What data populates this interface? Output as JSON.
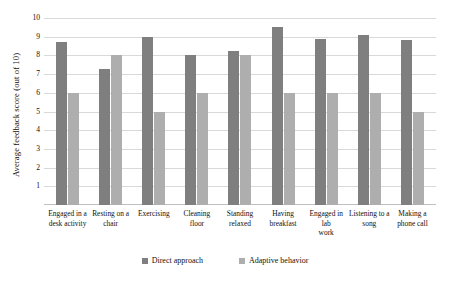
{
  "chart_data": {
    "type": "bar",
    "title": "",
    "xlabel": "",
    "ylabel": "Average feedback score (out of 10)",
    "ylim": [
      0,
      10
    ],
    "ytick_labels": [
      "10",
      "9",
      "8",
      "7",
      "6",
      "5",
      "4",
      "3",
      "2",
      "1"
    ],
    "ytick_values": [
      10,
      9,
      8,
      7,
      6,
      5,
      4,
      3,
      2,
      1
    ],
    "grid": true,
    "legend_position": "bottom",
    "categories": [
      "Engaged in a desk activity",
      "Resting on a chair",
      "Exercising",
      "Cleaning floor",
      "Standing relaxed",
      "Having breakfast",
      "Engaged in lab work",
      "Listening to a song",
      "Making a phone call"
    ],
    "category_lines": [
      [
        "Engaged in a",
        "desk activity"
      ],
      [
        "Resting on a",
        "chair"
      ],
      [
        "Exercising",
        ""
      ],
      [
        "Cleaning floor",
        ""
      ],
      [
        "Standing",
        "relaxed"
      ],
      [
        "Having",
        "breakfast"
      ],
      [
        "Engaged in lab",
        "work"
      ],
      [
        "Listening to a",
        "song"
      ],
      [
        "Making a",
        "phone call"
      ]
    ],
    "series": [
      {
        "name": "Direct approach",
        "color": "#7f7f7f",
        "values": [
          8.7,
          7.3,
          9.0,
          8.0,
          8.25,
          9.5,
          8.9,
          9.1,
          8.85
        ]
      },
      {
        "name": "Adaptive behavior",
        "color": "#aeaeae",
        "values": [
          6.0,
          8.0,
          5.0,
          6.0,
          8.0,
          6.0,
          6.0,
          6.0,
          5.0
        ]
      }
    ]
  }
}
